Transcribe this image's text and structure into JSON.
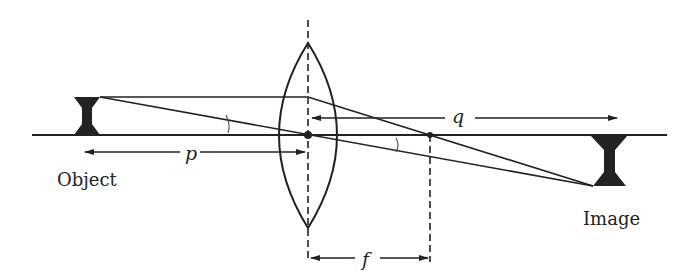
{
  "diagram": {
    "type": "thin-lens-ray-diagram",
    "labels": {
      "object": "Object",
      "image": "Image",
      "object_distance": "p",
      "image_distance": "q",
      "focal_length": "f"
    },
    "colors": {
      "ink": "#222222",
      "background": "#ffffff"
    },
    "geometry": {
      "axis_y": 135,
      "lens_x": 308,
      "focal_point_x": 430,
      "object_x": 87,
      "object_top_y": 97,
      "image_x": 609,
      "image_bottom_y": 186
    }
  }
}
